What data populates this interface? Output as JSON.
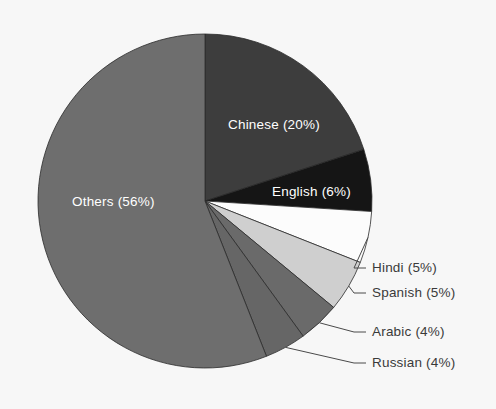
{
  "chart_data": {
    "type": "pie",
    "title": "",
    "subtitle": "",
    "xlabel": "",
    "ylabel": "",
    "legend_position": "none",
    "grid": false,
    "start_angle_deg": 0,
    "direction": "clockwise",
    "categories": [
      "Chinese",
      "English",
      "Hindi",
      "Spanish",
      "Arabic",
      "Russian",
      "Others"
    ],
    "values": [
      20,
      6,
      5,
      5,
      4,
      4,
      56
    ],
    "unit": "%",
    "slices": [
      {
        "name": "Chinese",
        "value": 20,
        "label": "Chinese (20%)",
        "color": "#3d3d3d",
        "label_color": "#ffffff",
        "label_placement": "inside",
        "label_x": 228,
        "label_y": 125
      },
      {
        "name": "English",
        "value": 6,
        "label": "English (6%)",
        "color": "#151515",
        "label_color": "#ffffff",
        "label_placement": "inside",
        "label_x": 272,
        "label_y": 192
      },
      {
        "name": "Hindi",
        "value": 5,
        "label": "Hindi (5%)",
        "color": "#fcfcfc",
        "label_color": "#3a3a3a",
        "label_placement": "outside",
        "label_x": 372,
        "label_y": 268
      },
      {
        "name": "Spanish",
        "value": 5,
        "label": "Spanish (5%)",
        "color": "#cfcfcf",
        "label_color": "#3a3a3a",
        "label_placement": "outside",
        "label_x": 372,
        "label_y": 293
      },
      {
        "name": "Arabic",
        "value": 4,
        "label": "Arabic (4%)",
        "color": "#6a6a6a",
        "label_color": "#3a3a3a",
        "label_placement": "outside",
        "label_x": 372,
        "label_y": 332
      },
      {
        "name": "Russian",
        "value": 4,
        "label": "Russian (4%)",
        "color": "#666666",
        "label_color": "#3a3a3a",
        "label_placement": "outside",
        "label_x": 372,
        "label_y": 363
      },
      {
        "name": "Others",
        "value": 56,
        "label": "Others (56%)",
        "color": "#6e6e6e",
        "label_color": "#ffffff",
        "label_placement": "inside",
        "label_x": 72,
        "label_y": 202
      }
    ],
    "geometry": {
      "center_x": 205,
      "center_y": 201,
      "radius": 167
    },
    "background_color": "#f7f7f7"
  }
}
